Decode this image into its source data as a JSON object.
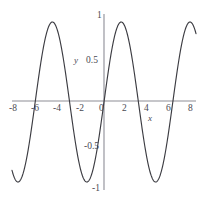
{
  "figure": {
    "name": "sine-function-graph",
    "curve_color": "#3c3c42",
    "axis_color": "#8d8d96",
    "label_color": "#4a4a52",
    "background": "#ffffff"
  },
  "axes": {
    "x_name": "x",
    "y_name": "y",
    "x_ticks": [
      {
        "key": "neg8",
        "label": "-8",
        "value": -8
      },
      {
        "key": "neg6",
        "label": "-6",
        "value": -6
      },
      {
        "key": "neg4",
        "label": "-4",
        "value": -4
      },
      {
        "key": "neg2",
        "label": "-2",
        "value": -2
      },
      {
        "key": "zero",
        "label": "0",
        "value": 0
      },
      {
        "key": "pos2",
        "label": "2",
        "value": 2
      },
      {
        "key": "pos4",
        "label": "4",
        "value": 4
      },
      {
        "key": "pos6",
        "label": "6",
        "value": 6
      },
      {
        "key": "pos8",
        "label": "8",
        "value": 8
      }
    ],
    "y_ticks": [
      {
        "key": "y1",
        "label": "1",
        "value": 1
      },
      {
        "key": "yhalf",
        "label": "0.5",
        "value": 0.5
      },
      {
        "key": "ynhalf",
        "label": "-0.5",
        "value": -0.5
      },
      {
        "key": "yn1",
        "label": "-1",
        "value": -1
      }
    ]
  },
  "chart_data": {
    "type": "line",
    "title": "",
    "xlabel": "x",
    "ylabel": "y",
    "xlim": [
      -8.4,
      8.4
    ],
    "ylim": [
      -1.1,
      1.1
    ],
    "grid": false,
    "legend": null,
    "xticks": [
      -8,
      -6,
      -4,
      -2,
      0,
      2,
      4,
      6,
      8
    ],
    "yticks": [
      -1,
      -0.5,
      0.5,
      1
    ],
    "series": [
      {
        "name": "y = sin(x)",
        "expression": "sin(x)",
        "color": "#3c3c42",
        "x": [
          -8.4,
          -8.0,
          -7.6,
          -7.2,
          -6.8,
          -6.4,
          -6.0,
          -5.6,
          -5.2,
          -4.8,
          -4.4,
          -4.0,
          -3.6,
          -3.2,
          -2.8,
          -2.4,
          -2.0,
          -1.6,
          -1.2,
          -0.8,
          -0.4,
          0.0,
          0.4,
          0.8,
          1.2,
          1.6,
          2.0,
          2.4,
          2.8,
          3.2,
          3.6,
          4.0,
          4.4,
          4.8,
          5.2,
          5.6,
          6.0,
          6.4,
          6.8,
          7.2,
          7.6,
          8.0,
          8.4
        ],
        "y": [
          -0.855,
          -0.989,
          -0.983,
          -0.794,
          -0.492,
          -0.117,
          0.279,
          0.631,
          0.883,
          0.996,
          0.952,
          0.757,
          0.443,
          0.058,
          -0.335,
          -0.675,
          -0.909,
          -1.0,
          -0.932,
          -0.717,
          -0.389,
          0.0,
          0.389,
          0.717,
          0.932,
          1.0,
          0.909,
          0.675,
          0.335,
          -0.058,
          -0.443,
          -0.757,
          -0.952,
          -0.996,
          -0.883,
          -0.631,
          -0.279,
          0.117,
          0.492,
          0.794,
          0.983,
          0.989,
          0.855
        ],
        "features": {
          "maxima_x": [
            -4.712,
            1.571,
            7.854
          ],
          "minima_x": [
            -7.854,
            -1.571,
            4.712
          ],
          "zeros_x": [
            -6.283,
            -3.142,
            0,
            3.142,
            6.283
          ],
          "amplitude": 1,
          "period": 6.283
        }
      }
    ]
  }
}
